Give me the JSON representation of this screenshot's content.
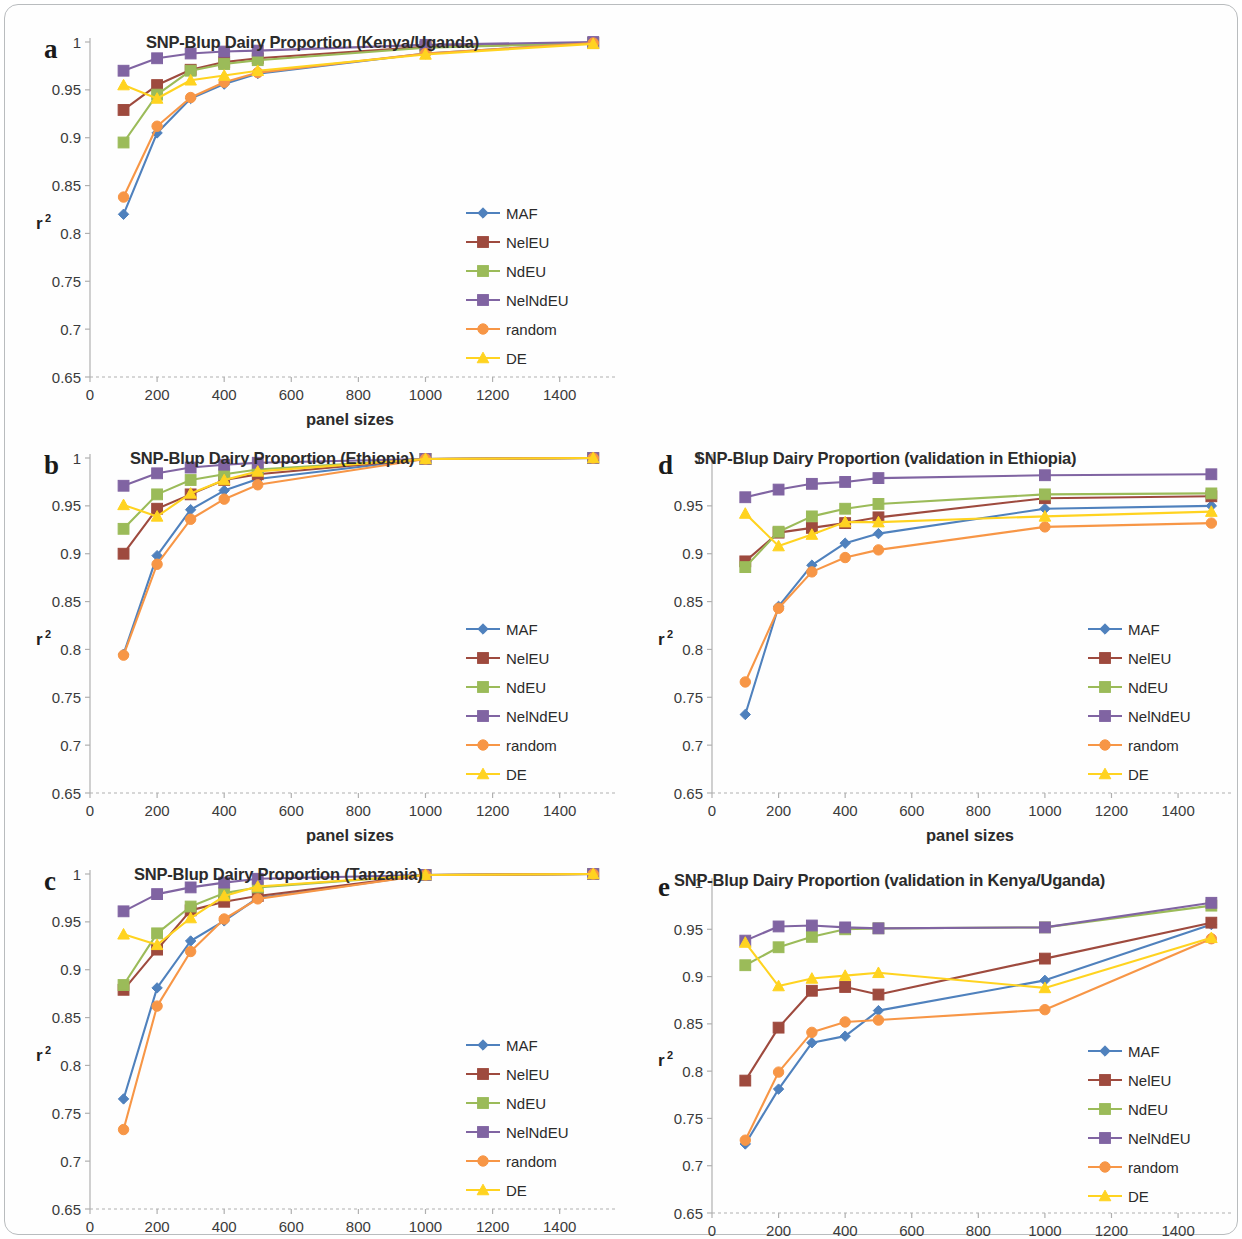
{
  "figure": {
    "axis_x_title": "panel sizes",
    "axis_y_title": "r",
    "axis_y_sup": "2",
    "panel_letters": [
      "a",
      "b",
      "c",
      "d",
      "e"
    ],
    "series_colors": {
      "MAF": "#4F81BD",
      "NelEU": "#9E4A3E",
      "NdEU": "#9BBB59",
      "NelNdEU": "#8064A2",
      "random": "#F79646",
      "DE": "#FFD320"
    },
    "series_markers": {
      "MAF": "diamond",
      "NelEU": "square",
      "NdEU": "square",
      "NelNdEU": "square",
      "random": "circle",
      "DE": "triangle"
    },
    "legend_order": [
      "MAF",
      "NelEU",
      "NdEU",
      "NelNdEU",
      "random",
      "DE"
    ]
  },
  "chart_data": [
    {
      "panel": "a",
      "type": "line",
      "title": "SNP-Blup Dairy Proportion (Kenya/Uganda)",
      "xlabel": "panel sizes",
      "ylabel": "r2",
      "x": [
        100,
        200,
        300,
        400,
        500,
        1000,
        1500
      ],
      "xlim": [
        0,
        1550
      ],
      "ylim": [
        0.65,
        1.0
      ],
      "xticks": [
        0,
        200,
        400,
        600,
        800,
        1000,
        1200,
        1400
      ],
      "yticks": [
        0.65,
        0.7,
        0.75,
        0.8,
        0.85,
        0.9,
        0.95,
        1
      ],
      "grid": false,
      "legend_position": "inside-right",
      "series": [
        {
          "name": "MAF",
          "values": [
            0.82,
            0.905,
            0.941,
            0.956,
            0.967,
            0.988,
            0.999
          ]
        },
        {
          "name": "NelEU",
          "values": [
            0.929,
            0.955,
            0.971,
            0.979,
            0.983,
            0.995,
            0.999
          ]
        },
        {
          "name": "NdEU",
          "values": [
            0.895,
            0.945,
            0.97,
            0.977,
            0.981,
            0.994,
            0.999
          ]
        },
        {
          "name": "NelNdEU",
          "values": [
            0.97,
            0.983,
            0.988,
            0.99,
            0.991,
            0.997,
            1.0
          ]
        },
        {
          "name": "random",
          "values": [
            0.838,
            0.912,
            0.942,
            0.958,
            0.968,
            0.988,
            0.999
          ]
        },
        {
          "name": "DE",
          "values": [
            0.955,
            0.941,
            0.96,
            0.965,
            0.97,
            0.987,
            0.998
          ]
        }
      ]
    },
    {
      "panel": "b",
      "type": "line",
      "title": "SNP-Blup Dairy Proportion (Ethiopia)",
      "xlabel": "panel sizes",
      "ylabel": "r2",
      "x": [
        100,
        200,
        300,
        400,
        500,
        1000,
        1500
      ],
      "xlim": [
        0,
        1550
      ],
      "ylim": [
        0.65,
        1.0
      ],
      "xticks": [
        0,
        200,
        400,
        600,
        800,
        1000,
        1200,
        1400
      ],
      "yticks": [
        0.65,
        0.7,
        0.75,
        0.8,
        0.85,
        0.9,
        0.95,
        1
      ],
      "grid": false,
      "legend_position": "inside-right",
      "series": [
        {
          "name": "MAF",
          "values": [
            0.795,
            0.898,
            0.946,
            0.966,
            0.978,
            0.999,
            1.0
          ]
        },
        {
          "name": "NelEU",
          "values": [
            0.9,
            0.947,
            0.962,
            0.977,
            0.983,
            0.999,
            1.0
          ]
        },
        {
          "name": "NdEU",
          "values": [
            0.926,
            0.962,
            0.977,
            0.983,
            0.988,
            0.999,
            1.0
          ]
        },
        {
          "name": "NelNdEU",
          "values": [
            0.971,
            0.984,
            0.99,
            0.993,
            0.995,
            0.999,
            1.0
          ]
        },
        {
          "name": "random",
          "values": [
            0.794,
            0.889,
            0.936,
            0.957,
            0.972,
            0.999,
            1.0
          ]
        },
        {
          "name": "DE",
          "values": [
            0.951,
            0.939,
            0.963,
            0.977,
            0.986,
            0.999,
            1.0
          ]
        }
      ]
    },
    {
      "panel": "c",
      "type": "line",
      "title": "SNP-Blup Dairy Proportion (Tanzania)",
      "xlabel": "panel sizes",
      "ylabel": "r2",
      "x": [
        100,
        200,
        300,
        400,
        500,
        1000,
        1500
      ],
      "xlim": [
        0,
        1550
      ],
      "ylim": [
        0.65,
        1.0
      ],
      "xticks": [
        0,
        200,
        400,
        600,
        800,
        1000,
        1200,
        1400
      ],
      "yticks": [
        0.65,
        0.7,
        0.75,
        0.8,
        0.85,
        0.9,
        0.95,
        1
      ],
      "grid": false,
      "legend_position": "inside-right",
      "series": [
        {
          "name": "MAF",
          "values": [
            0.765,
            0.881,
            0.93,
            0.951,
            0.975,
            0.999,
            1.0
          ]
        },
        {
          "name": "NelEU",
          "values": [
            0.879,
            0.921,
            0.962,
            0.971,
            0.977,
            0.999,
            1.0
          ]
        },
        {
          "name": "NdEU",
          "values": [
            0.884,
            0.938,
            0.966,
            0.98,
            0.986,
            0.999,
            1.0
          ]
        },
        {
          "name": "NelNdEU",
          "values": [
            0.961,
            0.979,
            0.986,
            0.991,
            0.995,
            0.999,
            1.0
          ]
        },
        {
          "name": "random",
          "values": [
            0.733,
            0.862,
            0.919,
            0.953,
            0.974,
            0.999,
            1.0
          ]
        },
        {
          "name": "DE",
          "values": [
            0.937,
            0.926,
            0.954,
            0.977,
            0.987,
            0.999,
            1.0
          ]
        }
      ]
    },
    {
      "panel": "d",
      "type": "line",
      "title": "SNP-Blup Dairy Proportion (validation in Ethiopia)",
      "xlabel": "panel sizes",
      "ylabel": "r2",
      "x": [
        100,
        200,
        300,
        400,
        500,
        1000,
        1500
      ],
      "xlim": [
        0,
        1550
      ],
      "ylim": [
        0.65,
        1.0
      ],
      "xticks": [
        0,
        200,
        400,
        600,
        800,
        1000,
        1200,
        1400
      ],
      "yticks": [
        0.65,
        0.7,
        0.75,
        0.8,
        0.85,
        0.9,
        0.95,
        1
      ],
      "grid": false,
      "legend_position": "inside-right",
      "series": [
        {
          "name": "MAF",
          "values": [
            0.732,
            0.845,
            0.888,
            0.911,
            0.921,
            0.947,
            0.95
          ]
        },
        {
          "name": "NelEU",
          "values": [
            0.892,
            0.922,
            0.927,
            0.932,
            0.938,
            0.958,
            0.96
          ]
        },
        {
          "name": "NdEU",
          "values": [
            0.886,
            0.923,
            0.939,
            0.947,
            0.952,
            0.962,
            0.963
          ]
        },
        {
          "name": "NelNdEU",
          "values": [
            0.959,
            0.967,
            0.973,
            0.975,
            0.979,
            0.982,
            0.983
          ]
        },
        {
          "name": "random",
          "values": [
            0.766,
            0.843,
            0.881,
            0.896,
            0.904,
            0.928,
            0.932
          ]
        },
        {
          "name": "DE",
          "values": [
            0.942,
            0.908,
            0.92,
            0.933,
            0.933,
            0.939,
            0.944
          ]
        }
      ]
    },
    {
      "panel": "e",
      "type": "line",
      "title": "SNP-Blup Dairy Proportion (validation in Kenya/Uganda)",
      "xlabel": "panel sizes",
      "ylabel": "r2",
      "x": [
        100,
        200,
        300,
        400,
        500,
        1000,
        1500
      ],
      "xlim": [
        0,
        1550
      ],
      "ylim": [
        0.65,
        1.0
      ],
      "xticks": [
        0,
        200,
        400,
        600,
        800,
        1000,
        1200,
        1400
      ],
      "yticks": [
        0.65,
        0.7,
        0.75,
        0.8,
        0.85,
        0.9,
        0.95,
        1
      ],
      "grid": false,
      "legend_position": "inside-right",
      "series": [
        {
          "name": "MAF",
          "values": [
            0.723,
            0.781,
            0.83,
            0.837,
            0.864,
            0.896,
            0.955
          ]
        },
        {
          "name": "NelEU",
          "values": [
            0.79,
            0.846,
            0.885,
            0.889,
            0.881,
            0.919,
            0.957
          ]
        },
        {
          "name": "NdEU",
          "values": [
            0.912,
            0.931,
            0.942,
            0.95,
            0.951,
            0.952,
            0.975
          ]
        },
        {
          "name": "NelNdEU",
          "values": [
            0.938,
            0.953,
            0.954,
            0.952,
            0.951,
            0.952,
            0.978
          ]
        },
        {
          "name": "random",
          "values": [
            0.727,
            0.799,
            0.841,
            0.852,
            0.854,
            0.865,
            0.94
          ]
        },
        {
          "name": "DE",
          "values": [
            0.936,
            0.89,
            0.898,
            0.901,
            0.904,
            0.888,
            0.941
          ]
        }
      ]
    }
  ]
}
